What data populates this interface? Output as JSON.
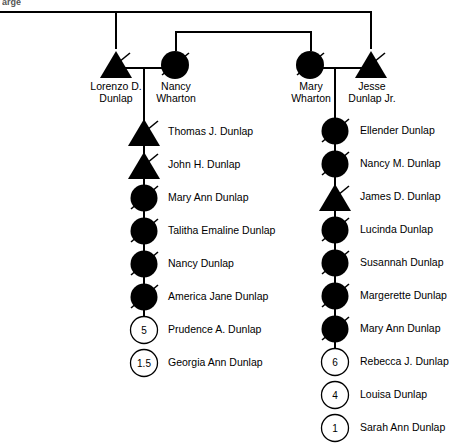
{
  "chart": {
    "title_fragment": "arge",
    "width": 456,
    "height": 443,
    "colors": {
      "affected_fill": "#000000",
      "unaffected_fill": "#ffffff",
      "stroke": "#000000",
      "background": "#ffffff"
    },
    "legend_notes": {
      "filled": "filled symbol = affected",
      "slash": "diagonal slash = deceased",
      "number": "number inside symbol = age / count"
    }
  },
  "generation1": {
    "couple_left": {
      "father": {
        "name": "Lorenzo D. Dunlap",
        "name_line1": "Lorenzo D.",
        "name_line2": "Dunlap",
        "sex": "male",
        "shape": "triangle",
        "filled": true,
        "deceased": true,
        "x": 116,
        "y": 45
      },
      "mother": {
        "name": "Nancy Wharton",
        "name_line1": "Nancy",
        "name_line2": "Wharton",
        "sex": "female",
        "shape": "circle",
        "filled": true,
        "deceased": true,
        "x": 175,
        "y": 45
      }
    },
    "couple_right": {
      "mother": {
        "name": "Mary Wharton",
        "name_line1": "Mary",
        "name_line2": "Wharton",
        "sex": "female",
        "shape": "circle",
        "filled": true,
        "deceased": true,
        "x": 310,
        "y": 45
      },
      "father": {
        "name": "Jesse Dunlap Jr.",
        "name_line1": "Jesse",
        "name_line2": "Dunlap Jr.",
        "sex": "male",
        "shape": "triangle",
        "filled": true,
        "deceased": true,
        "x": 370,
        "y": 45
      }
    }
  },
  "children_left": [
    {
      "name": "Thomas J. Dunlap",
      "shape": "triangle",
      "filled": true,
      "deceased": true,
      "number": ""
    },
    {
      "name": "John H. Dunlap",
      "shape": "triangle",
      "filled": true,
      "deceased": true,
      "number": ""
    },
    {
      "name": "Mary Ann Dunlap",
      "shape": "circle",
      "filled": true,
      "deceased": true,
      "number": ""
    },
    {
      "name": "Talitha Emaline Dunlap",
      "shape": "circle",
      "filled": true,
      "deceased": true,
      "number": ""
    },
    {
      "name": "Nancy Dunlap",
      "shape": "circle",
      "filled": true,
      "deceased": true,
      "number": ""
    },
    {
      "name": "America Jane Dunlap",
      "shape": "circle",
      "filled": true,
      "deceased": true,
      "number": ""
    },
    {
      "name": "Prudence A. Dunlap",
      "shape": "circle",
      "filled": false,
      "deceased": false,
      "number": "5"
    },
    {
      "name": "Georgia Ann Dunlap",
      "shape": "circle",
      "filled": false,
      "deceased": false,
      "number": "1.5"
    }
  ],
  "children_right": [
    {
      "name": "Ellender Dunlap",
      "shape": "circle",
      "filled": true,
      "deceased": true,
      "number": ""
    },
    {
      "name": "Nancy M. Dunlap",
      "shape": "circle",
      "filled": true,
      "deceased": true,
      "number": ""
    },
    {
      "name": "James D. Dunlap",
      "shape": "triangle",
      "filled": true,
      "deceased": true,
      "number": ""
    },
    {
      "name": "Lucinda Dunlap",
      "shape": "circle",
      "filled": true,
      "deceased": true,
      "number": ""
    },
    {
      "name": "Susannah Dunlap",
      "shape": "circle",
      "filled": true,
      "deceased": true,
      "number": ""
    },
    {
      "name": "Margerette Dunlap",
      "shape": "circle",
      "filled": true,
      "deceased": true,
      "number": ""
    },
    {
      "name": "Mary Ann Dunlap",
      "shape": "circle",
      "filled": true,
      "deceased": true,
      "number": ""
    },
    {
      "name": "Rebecca J. Dunlap",
      "shape": "circle",
      "filled": false,
      "deceased": false,
      "number": "6"
    },
    {
      "name": "Louisa Dunlap",
      "shape": "circle",
      "filled": false,
      "deceased": false,
      "number": "4"
    },
    {
      "name": "Sarah Ann Dunlap",
      "shape": "circle",
      "filled": false,
      "deceased": false,
      "number": "1"
    }
  ]
}
